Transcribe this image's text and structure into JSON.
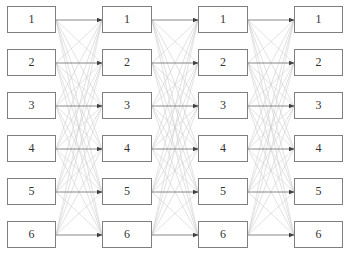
{
  "diagram": {
    "type": "fully-connected-layered-graph",
    "columns": [
      {
        "index": 0,
        "labels": [
          "1",
          "2",
          "3",
          "4",
          "5",
          "6"
        ]
      },
      {
        "index": 1,
        "labels": [
          "1",
          "2",
          "3",
          "4",
          "5",
          "6"
        ]
      },
      {
        "index": 2,
        "labels": [
          "1",
          "2",
          "3",
          "4",
          "5",
          "6"
        ]
      },
      {
        "index": 3,
        "labels": [
          "1",
          "2",
          "3",
          "4",
          "5",
          "6"
        ]
      }
    ],
    "edges": "every node in column i connects to every node in column i+1; same-row edges drawn darker with arrowheads",
    "colors": {
      "node_border": "#7f7f7f",
      "cross_edge": "#cfcfcf",
      "straight_edge": "#7a7a7a",
      "arrowhead": "#404040",
      "text": "#333333"
    }
  }
}
